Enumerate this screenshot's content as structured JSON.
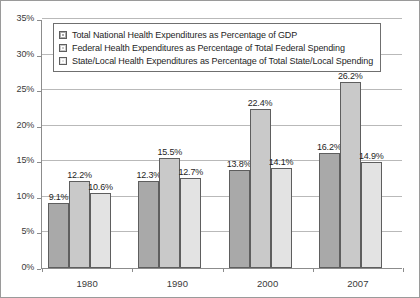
{
  "chart_data": {
    "type": "bar",
    "title": "",
    "xlabel": "",
    "ylabel": "",
    "categories": [
      "1980",
      "1990",
      "2000",
      "2007"
    ],
    "ylim": [
      0,
      35
    ],
    "ytick_values": [
      0,
      5,
      10,
      15,
      20,
      25,
      30,
      35
    ],
    "ytick_labels": [
      "0%",
      "5%",
      "10%",
      "15%",
      "20%",
      "25%",
      "30%",
      "35%"
    ],
    "grid": true,
    "legend_position": "top-left",
    "series": [
      {
        "name": "Total National Health Expenditures as Percentage of GDP",
        "color": "#a9a9a9",
        "values": [
          9.1,
          12.3,
          13.8,
          16.2
        ],
        "labels": [
          "9.1%",
          "12.3%",
          "13.8%",
          "16.2%"
        ]
      },
      {
        "name": "Federal Health Expenditures as Percentage of Total Federal Spending",
        "color": "#c9c9c9",
        "values": [
          12.2,
          15.5,
          22.4,
          26.2
        ],
        "labels": [
          "12.2%",
          "15.5%",
          "22.4%",
          "26.2%"
        ]
      },
      {
        "name": "State/Local Health Expenditures as Percentage of Total State/Local Spending",
        "color": "#e3e3e3",
        "values": [
          10.6,
          12.7,
          14.1,
          14.9
        ],
        "labels": [
          "10.6%",
          "12.7%",
          "14.1%",
          "14.9%"
        ]
      }
    ]
  }
}
